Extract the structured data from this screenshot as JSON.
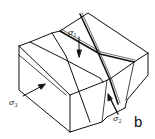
{
  "figure": {
    "panel_label": "b",
    "stress_labels": {
      "sigma1": {
        "symbol": "σ",
        "subscript": "1"
      },
      "sigma2": {
        "symbol": "σ",
        "subscript": "2"
      },
      "sigma3": {
        "symbol": "σ",
        "subscript": "3"
      }
    },
    "colors": {
      "line": "#111111",
      "background": "#ffffff"
    }
  }
}
